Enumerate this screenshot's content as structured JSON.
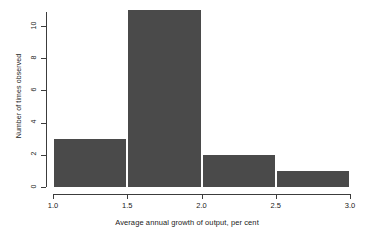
{
  "chart_data": {
    "type": "bar",
    "subtype": "histogram",
    "title": "",
    "xlabel": "Average annual growth of output, per cent",
    "ylabel": "Number of times observed",
    "xlim": [
      1.0,
      3.0
    ],
    "ylim": [
      0,
      11
    ],
    "grid": false,
    "legend": null,
    "bar_color": "#4a4a4a",
    "axis_color": "#3c3c3c",
    "background_color": "#ffffff",
    "bin_width": 0.5,
    "bin_edges": [
      1.0,
      1.5,
      2.0,
      2.5,
      3.0
    ],
    "categories": [
      "1.0-1.5",
      "1.5-2.0",
      "2.0-2.5",
      "2.5-3.0"
    ],
    "values": [
      3,
      11,
      2,
      1
    ],
    "bars": [
      {
        "label": "1.0-1.5",
        "x0": 1.0,
        "x1": 1.5,
        "value": 3
      },
      {
        "label": "1.5-2.0",
        "x0": 1.5,
        "x1": 2.0,
        "value": 11
      },
      {
        "label": "2.0-2.5",
        "x0": 2.0,
        "x1": 2.5,
        "value": 2
      },
      {
        "label": "2.5-3.0",
        "x0": 2.5,
        "x1": 3.0,
        "value": 1
      }
    ],
    "x_ticks": [
      {
        "value": 1.0,
        "label": "1.0"
      },
      {
        "value": 1.5,
        "label": "1.5"
      },
      {
        "value": 2.0,
        "label": "2.0"
      },
      {
        "value": 2.5,
        "label": "2.5"
      },
      {
        "value": 3.0,
        "label": "3.0"
      }
    ],
    "y_ticks": [
      {
        "value": 0,
        "label": "0"
      },
      {
        "value": 2,
        "label": "2"
      },
      {
        "value": 4,
        "label": "4"
      },
      {
        "value": 6,
        "label": "6"
      },
      {
        "value": 8,
        "label": "8"
      },
      {
        "value": 10,
        "label": "10"
      }
    ]
  }
}
